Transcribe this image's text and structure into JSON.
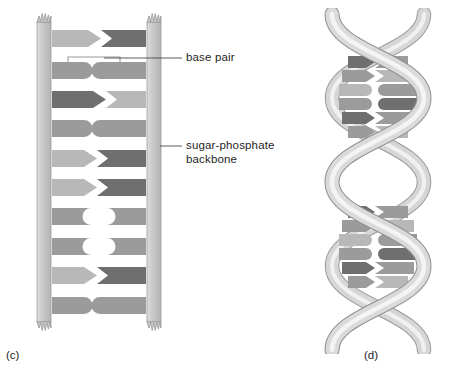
{
  "figure": {
    "kind": "dna-structure-diagram",
    "panels": [
      {
        "id": "c",
        "caption": "(c)",
        "name": "ladder-model",
        "description": "Flat ladder representation of the DNA double helix"
      },
      {
        "id": "d",
        "caption": "(d)",
        "name": "helix-model",
        "description": "Twisted double-helix representation of DNA"
      }
    ]
  },
  "annotations": {
    "base_pair": {
      "text": "base pair",
      "leader": {
        "x1": 104,
        "y1": 58,
        "x2": 182,
        "y2": 58
      }
    },
    "backbone": {
      "line1": "sugar-phosphate",
      "line2": "backbone",
      "text": "sugar-phosphate backbone",
      "leader": {
        "x1": 158,
        "y1": 146,
        "x2": 182,
        "y2": 146
      }
    }
  },
  "colors": {
    "page_background": "#ffffff",
    "ink": "#1e1e1e",
    "backbone_fill": "#c9c9c9",
    "backbone_edge": "#8e8e8e",
    "backbone_highlight": "#dcdcdc",
    "base_light": "#b8b8b8",
    "base_medium": "#9b9b9b",
    "base_dark": "#6f6f6f",
    "base_pale": "#cfcfcf",
    "ribbon_fill": "#d5d5d5",
    "ribbon_edge": "#8a8a8a",
    "ribbon_highlight": "#efefef"
  },
  "ladder": {
    "rail_left": {
      "x": 36,
      "width": 16,
      "y": 14,
      "height": 316
    },
    "rail_right": {
      "x": 146,
      "width": 16,
      "y": 14,
      "height": 316
    },
    "inner_left": 52,
    "inner_right": 146,
    "rung_height": 17,
    "rungs": [
      {
        "index": 0,
        "y": 30,
        "left": {
          "shade": "base_light",
          "end": "point"
        },
        "right": {
          "shade": "base_dark",
          "end": "notch"
        }
      },
      {
        "index": 1,
        "y": 62,
        "left": {
          "shade": "base_medium",
          "end": "round"
        },
        "right": {
          "shade": "base_medium",
          "end": "cup"
        }
      },
      {
        "index": 2,
        "y": 91,
        "left": {
          "shade": "base_dark",
          "end": "point"
        },
        "right": {
          "shade": "base_light",
          "end": "notch"
        }
      },
      {
        "index": 3,
        "y": 120,
        "left": {
          "shade": "base_medium",
          "end": "round"
        },
        "right": {
          "shade": "base_medium",
          "end": "cup"
        }
      },
      {
        "index": 4,
        "y": 150,
        "left": {
          "shade": "base_light",
          "end": "point"
        },
        "right": {
          "shade": "base_dark",
          "end": "notch"
        }
      },
      {
        "index": 5,
        "y": 179,
        "left": {
          "shade": "base_light",
          "end": "point"
        },
        "right": {
          "shade": "base_dark",
          "end": "notch"
        }
      },
      {
        "index": 6,
        "y": 208,
        "left": {
          "shade": "base_medium",
          "end": "cup"
        },
        "right": {
          "shade": "base_medium",
          "end": "round"
        }
      },
      {
        "index": 7,
        "y": 238,
        "left": {
          "shade": "base_medium",
          "end": "cup"
        },
        "right": {
          "shade": "base_medium",
          "end": "round"
        }
      },
      {
        "index": 8,
        "y": 267,
        "left": {
          "shade": "base_light",
          "end": "point"
        },
        "right": {
          "shade": "base_dark",
          "end": "notch"
        }
      },
      {
        "index": 9,
        "y": 297,
        "left": {
          "shade": "base_medium",
          "end": "round"
        },
        "right": {
          "shade": "base_medium",
          "end": "cup"
        }
      }
    ],
    "bracket": {
      "x1": 68,
      "x2": 120,
      "y": 56,
      "note": "thin bracket marking one base pair"
    }
  },
  "helix": {
    "center_x": 378,
    "top": 14,
    "bottom": 340,
    "amplitude": 46,
    "period": 150,
    "ribbon_width": 13,
    "rung_groups": [
      {
        "name": "upper-cluster",
        "rungs": [
          {
            "y": 62,
            "shade_left": "base_dark",
            "shade_right": "base_medium",
            "half_width": 30
          },
          {
            "y": 76,
            "shade_left": "base_medium",
            "shade_right": "base_light",
            "half_width": 36
          },
          {
            "y": 90,
            "shade_left": "base_light",
            "shade_right": "base_medium",
            "half_width": 39
          },
          {
            "y": 104,
            "shade_left": "base_medium",
            "shade_right": "base_dark",
            "half_width": 39
          },
          {
            "y": 118,
            "shade_left": "base_dark",
            "shade_right": "base_medium",
            "half_width": 36
          },
          {
            "y": 132,
            "shade_left": "base_medium",
            "shade_right": "base_light",
            "half_width": 30
          }
        ]
      },
      {
        "name": "lower-cluster",
        "rungs": [
          {
            "y": 212,
            "shade_left": "base_dark",
            "shade_right": "base_medium",
            "half_width": 30
          },
          {
            "y": 226,
            "shade_left": "base_medium",
            "shade_right": "base_light",
            "half_width": 36
          },
          {
            "y": 240,
            "shade_left": "base_light",
            "shade_right": "base_medium",
            "half_width": 39
          },
          {
            "y": 254,
            "shade_left": "base_medium",
            "shade_right": "base_dark",
            "half_width": 39
          },
          {
            "y": 268,
            "shade_left": "base_dark",
            "shade_right": "base_medium",
            "half_width": 36
          },
          {
            "y": 282,
            "shade_left": "base_medium",
            "shade_right": "base_light",
            "half_width": 30
          }
        ]
      }
    ]
  }
}
